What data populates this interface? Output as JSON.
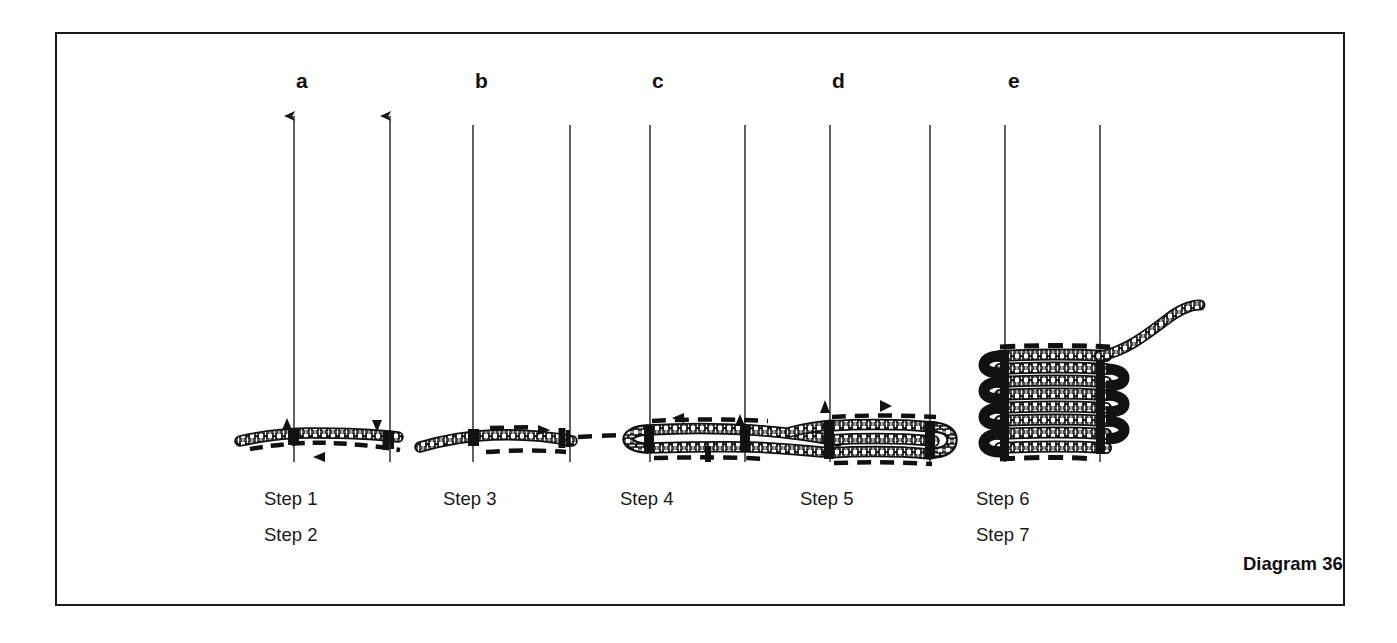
{
  "figure": {
    "caption": "Diagram 36",
    "background_color": "#ffffff",
    "ink_color": "#111111",
    "frame": {
      "stroke": "#1b1b1b",
      "x": 55,
      "y": 32,
      "width": 1290,
      "height": 574
    }
  },
  "panels": [
    {
      "letter": "a",
      "letter_x": 296,
      "letter_y": 70,
      "spars": [
        {
          "x": 294,
          "top": 114,
          "bottom": 462,
          "arrowhead": true
        },
        {
          "x": 390,
          "top": 114,
          "bottom": 462,
          "arrowhead": true
        }
      ],
      "steps": [
        {
          "label": "Step 1",
          "x": 296,
          "y": 490
        },
        {
          "label": "Step 2",
          "x": 296,
          "y": 526
        }
      ],
      "markers": [
        {
          "icon": "arrow-up-marker",
          "x": 287,
          "y": 424,
          "dir": "up"
        },
        {
          "icon": "arrow-down-marker",
          "x": 377,
          "y": 424,
          "dir": "down"
        },
        {
          "icon": "arrow-left-marker",
          "x": 320,
          "y": 457,
          "dir": "left"
        }
      ]
    },
    {
      "letter": "b",
      "letter_x": 475,
      "letter_y": 70,
      "spars": [
        {
          "x": 473,
          "top": 125,
          "bottom": 462,
          "arrowhead": false
        },
        {
          "x": 570,
          "top": 125,
          "bottom": 462,
          "arrowhead": false
        }
      ],
      "steps": [
        {
          "label": "Step 3",
          "x": 475,
          "y": 490
        }
      ],
      "markers": [
        {
          "icon": "arrow-right-marker",
          "x": 545,
          "y": 430,
          "dir": "right"
        }
      ]
    },
    {
      "letter": "c",
      "letter_x": 652,
      "letter_y": 70,
      "spars": [
        {
          "x": 650,
          "top": 125,
          "bottom": 462,
          "arrowhead": false
        },
        {
          "x": 745,
          "top": 125,
          "bottom": 462,
          "arrowhead": false
        }
      ],
      "steps": [
        {
          "label": "Step 4",
          "x": 652,
          "y": 490
        }
      ],
      "markers": [
        {
          "icon": "arrow-left-marker",
          "x": 678,
          "y": 418,
          "dir": "left"
        },
        {
          "icon": "arrow-up-marker",
          "x": 740,
          "y": 420,
          "dir": "up"
        }
      ]
    },
    {
      "letter": "d",
      "letter_x": 832,
      "letter_y": 70,
      "spars": [
        {
          "x": 830,
          "top": 125,
          "bottom": 462,
          "arrowhead": false
        },
        {
          "x": 930,
          "top": 125,
          "bottom": 462,
          "arrowhead": false
        }
      ],
      "steps": [
        {
          "label": "Step 5",
          "x": 832,
          "y": 490
        }
      ],
      "markers": [
        {
          "icon": "arrow-up-marker",
          "x": 825,
          "y": 405,
          "dir": "up"
        },
        {
          "icon": "arrow-right-marker",
          "x": 886,
          "y": 406,
          "dir": "right"
        }
      ]
    },
    {
      "letter": "e",
      "letter_x": 1008,
      "letter_y": 70,
      "spars": [
        {
          "x": 1005,
          "top": 125,
          "bottom": 462,
          "arrowhead": false
        },
        {
          "x": 1100,
          "top": 125,
          "bottom": 462,
          "arrowhead": false
        }
      ],
      "steps": [
        {
          "label": "Step 6",
          "x": 1008,
          "y": 490
        },
        {
          "label": "Step 7",
          "x": 1008,
          "y": 526
        }
      ],
      "markers": []
    }
  ],
  "caption_position": {
    "x": 1243,
    "y": 562
  }
}
